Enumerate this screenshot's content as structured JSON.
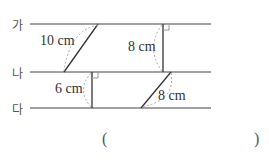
{
  "lines": [
    {
      "label": "가",
      "y": 24
    },
    {
      "label": "나",
      "y": 72
    },
    {
      "label": "다",
      "y": 108
    }
  ],
  "measurements": {
    "slant_top": "10 cm",
    "perp_top": "8 cm",
    "perp_bottom": "6 cm",
    "slant_bottom": "8 cm"
  },
  "answer": {
    "open": "(",
    "close": ")"
  }
}
